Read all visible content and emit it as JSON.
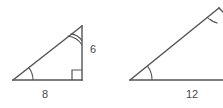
{
  "figure": {
    "type": "geometry-similar-triangles",
    "background_color": "#ffffff",
    "stroke_color": "#555555",
    "label_color": "#4a4a4a",
    "triangles": [
      {
        "id": "left-triangle",
        "name": "right-triangle-8-6",
        "description": "right triangle with horizontal leg labeled 8 and vertical leg labeled 6",
        "vertices": {
          "bottom_left": [
            13,
            80
          ],
          "bottom_right": [
            82,
            80
          ],
          "top_right": [
            82,
            26
          ]
        },
        "labels": {
          "base": "8",
          "vertical": "6"
        },
        "label_positions": {
          "base": [
            45,
            95
          ],
          "vertical": [
            93,
            50
          ]
        },
        "marks": {
          "right_angle_at": "bottom_right",
          "single_arc_at": "bottom_left",
          "double_arc_at": "top_right"
        }
      },
      {
        "id": "right-triangle",
        "name": "triangle-12",
        "description": "larger similar triangle, cropped at right edge, base labeled 12",
        "vertices": {
          "bottom_left": [
            130,
            80
          ],
          "bottom_right": [
            223,
            80
          ],
          "top_right": [
            219,
            8
          ]
        },
        "labels": {
          "base": "12"
        },
        "label_positions": {
          "base": [
            192,
            95
          ]
        },
        "marks": {
          "single_arc_at": "bottom_left",
          "double_arc_at": "top_right"
        }
      }
    ]
  }
}
